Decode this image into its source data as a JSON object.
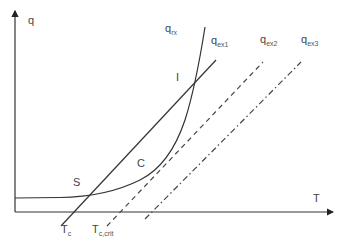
{
  "diagram": {
    "axes": {
      "y_label": "q",
      "x_label": "T"
    },
    "curves": [
      {
        "id": "qrx",
        "label_main": "q",
        "label_sub": "rx",
        "style": "solid",
        "kind": "exponential-curve"
      },
      {
        "id": "qex1",
        "label_main": "q",
        "label_sub": "ex1",
        "style": "solid",
        "kind": "straight-line"
      },
      {
        "id": "qex2",
        "label_main": "q",
        "label_sub": "ex2",
        "style": "dashed",
        "kind": "straight-line"
      },
      {
        "id": "qex3",
        "label_main": "q",
        "label_sub": "ex3",
        "style": "dash-dot",
        "kind": "straight-line"
      }
    ],
    "points": [
      {
        "id": "S",
        "label": "S",
        "meaning": "intersection of qrx and qex1 (lower)"
      },
      {
        "id": "I",
        "label": "I",
        "meaning": "intersection of qrx and qex1 (upper)"
      },
      {
        "id": "C",
        "label": "C",
        "meaning": "tangent point of qex2 with qrx"
      }
    ],
    "x_markers": [
      {
        "id": "Tc",
        "label_main": "T",
        "label_sub": "c"
      },
      {
        "id": "Tccrit",
        "label_main": "T",
        "label_sub": "c,crit"
      }
    ],
    "colors": {
      "line": "#333333",
      "text": "#444444",
      "background": "#ffffff"
    }
  }
}
